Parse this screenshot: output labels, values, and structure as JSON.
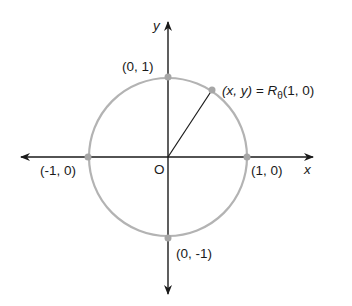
{
  "diagram": {
    "axes": {
      "x_label": "x",
      "y_label": "y",
      "origin_label": "O"
    },
    "points": [
      {
        "id": "top",
        "label": "(0, 1)"
      },
      {
        "id": "right",
        "label": "(1, 0)"
      },
      {
        "id": "left",
        "label": "(-1, 0)"
      },
      {
        "id": "bottom",
        "label": "(0, -1)"
      }
    ],
    "rotated_point": {
      "lhs": "(x, y) = ",
      "R": "R",
      "sub": "θ",
      "rhs": "(1, 0)"
    },
    "colors": {
      "circle": "#b3b3b3",
      "axis": "#1a1a1a",
      "point": "#a6a6a6"
    }
  }
}
